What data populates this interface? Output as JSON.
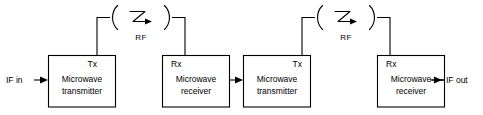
{
  "diagram": {
    "colors": {
      "line": "#000000",
      "background": "#ffffff",
      "box_fill": "#ffffff"
    },
    "io": {
      "input_label": "IF in",
      "output_label": "IF out"
    },
    "links": [
      {
        "id": "rf-link-1",
        "label": "RF",
        "symbol": "rf-wave-arrow-icon"
      },
      {
        "id": "rf-link-2",
        "label": "RF",
        "symbol": "rf-wave-arrow-icon"
      }
    ],
    "blocks": [
      {
        "id": "block-1",
        "port": "Tx",
        "line1": "Microwave",
        "line2": "transmitter"
      },
      {
        "id": "block-2",
        "port": "Rx",
        "line1": "Microwave",
        "line2": "receiver"
      },
      {
        "id": "block-3",
        "port": "Tx",
        "line1": "Microwave",
        "line2": "transmitter"
      },
      {
        "id": "block-4",
        "port": "Rx",
        "line1": "Microwave",
        "line2": "receiver"
      }
    ]
  }
}
